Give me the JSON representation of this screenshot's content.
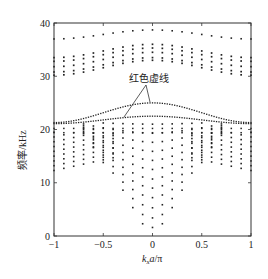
{
  "chart_data": {
    "type": "scatter",
    "title": "",
    "xlabel": "k_x a/π",
    "ylabel": "频率/kHz",
    "xlim": [
      -1,
      1
    ],
    "ylim": [
      0,
      40
    ],
    "xticks": [
      -1,
      -0.5,
      0,
      0.5,
      1
    ],
    "xtick_labels": [
      "−1",
      "−0.5",
      "0",
      "0.5",
      "1"
    ],
    "yticks": [
      0,
      10,
      20,
      30,
      40
    ],
    "ytick_labels": [
      "0",
      "10",
      "20",
      "30",
      "40"
    ],
    "grid": false,
    "legend": null,
    "annotation": {
      "text": "红色虚线",
      "points_to": [
        {
          "x": 0.0,
          "y": 25.0
        },
        {
          "x": -0.2,
          "y": 22.4
        }
      ]
    },
    "series": [
      {
        "name": "top band",
        "k_samples": 21,
        "y_at_edge": 37.0,
        "y_at_center": 38.7
      },
      {
        "name": "upper group band 1",
        "y_at_edge": 33.5,
        "y_at_center": 36.0
      },
      {
        "name": "upper group band 2",
        "y_at_edge": 32.8,
        "y_at_center": 35.3
      },
      {
        "name": "upper group band 3",
        "y_at_edge": 31.8,
        "y_at_center": 34.5
      },
      {
        "name": "upper group band 4",
        "y_at_edge": 30.8,
        "y_at_center": 33.5
      },
      {
        "name": "upper group band 5",
        "y_at_edge": 30.2,
        "y_at_center": 33.0
      },
      {
        "name": "red dashed band 1",
        "y_at_edge": 21.3,
        "y_at_center": 25.0,
        "highlight": true
      },
      {
        "name": "red dashed band 2",
        "y_at_edge": 21.1,
        "y_at_center": 22.5,
        "highlight": true
      },
      {
        "name": "lower group bands (nested parabolas)",
        "min_at_center": [
          1.6,
          3.4,
          5.3,
          7.2,
          9.0,
          10.7,
          12.5,
          14.2,
          15.9,
          17.6,
          19.3,
          21.0
        ],
        "edge_range": [
          14.3,
          19.0
        ]
      }
    ]
  },
  "annotation_label": "红色虚线",
  "xlabel_display": "kxa/π",
  "ylabel_display": "频率/kHz"
}
